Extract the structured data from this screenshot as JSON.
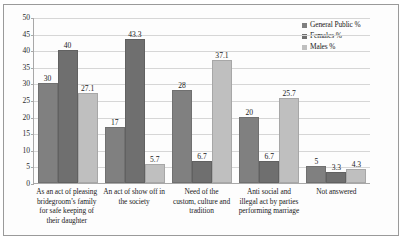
{
  "chart_data": {
    "type": "bar",
    "title": "",
    "subtitle": "",
    "xlabel": "",
    "ylabel": "",
    "ylim": [
      0,
      50
    ],
    "ytick_step": 5,
    "yticks": [
      "0",
      "5",
      "10",
      "15",
      "20",
      "25",
      "30",
      "35",
      "40",
      "45",
      "50"
    ],
    "grid": true,
    "legend_position": "top-right",
    "categories": [
      "As an act of pleasing bridegroom’s family for safe keeping of their daughter",
      "An act of show off in the society",
      "Need of the custom, culture and tradition",
      "Anti social and illegal act by parties performing marriage",
      "Not answered"
    ],
    "category_lines": [
      [
        "As an act of pleasing",
        "bridegroom’s family",
        "for safe keeping of",
        "their daughter"
      ],
      [
        "An act of show off in",
        "the society"
      ],
      [
        "Need of the",
        "custom, culture and",
        "tradition"
      ],
      [
        "Anti social and",
        "illegal act by parties",
        "performing marriage"
      ],
      [
        "Not answered"
      ]
    ],
    "series": [
      {
        "name": "General Public %",
        "color": "#808080",
        "values": [
          30,
          17,
          28,
          20,
          5
        ],
        "labels": [
          "30",
          "17",
          "28",
          "20",
          "5"
        ]
      },
      {
        "name": "Females %",
        "color": "#6f6f6f",
        "values": [
          40,
          43.3,
          6.7,
          6.7,
          3.3
        ],
        "labels": [
          "40",
          "43.3",
          "6.7",
          "6.7",
          "3.3"
        ]
      },
      {
        "name": "Males %",
        "color": "#bfbfbf",
        "values": [
          27.1,
          5.7,
          37.1,
          25.7,
          4.3
        ],
        "labels": [
          "27.1",
          "5.7",
          "37.1",
          "25.7",
          "4.3"
        ]
      }
    ]
  }
}
